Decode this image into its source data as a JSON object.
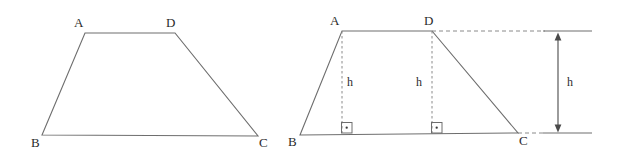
{
  "figure": {
    "stroke_color": "#6e6e6e",
    "dash_color": "#8a8a8a",
    "text_color": "#2b2b2b",
    "background_color": "#ffffff",
    "left_figure": {
      "name": "trapezoid-plain",
      "vertices": [
        {
          "id": "A",
          "label": "A",
          "x": 85,
          "y": 33,
          "label_x": 74,
          "label_y": 16
        },
        {
          "id": "D",
          "label": "D",
          "x": 175,
          "y": 33,
          "label_x": 166,
          "label_y": 16
        },
        {
          "id": "C",
          "label": "C",
          "x": 258,
          "y": 136,
          "label_x": 259,
          "label_y": 136
        },
        {
          "id": "B",
          "label": "B",
          "x": 42,
          "y": 135,
          "label_x": 31,
          "label_y": 136
        }
      ],
      "outline": "85,33 175,33 258,136 42,135"
    },
    "right_figure": {
      "name": "trapezoid-with-heights",
      "vertices": [
        {
          "id": "A",
          "label": "A",
          "x": 342,
          "y": 31,
          "label_x": 330,
          "label_y": 14
        },
        {
          "id": "D",
          "label": "D",
          "x": 432,
          "y": 31,
          "label_x": 424,
          "label_y": 14
        },
        {
          "id": "C",
          "label": "C",
          "x": 518,
          "y": 133,
          "label_x": 519,
          "label_y": 134
        },
        {
          "id": "B",
          "label": "B",
          "x": 300,
          "y": 135,
          "label_x": 288,
          "label_y": 135
        }
      ],
      "outline": "342,31 432,31 518,133 300,135",
      "altitudes": [
        {
          "name": "altitude-from-A",
          "x": 342,
          "y1": 31,
          "y2": 133,
          "label": "h",
          "label_x": 347,
          "label_y": 76
        },
        {
          "name": "altitude-from-D",
          "x": 432,
          "y1": 31,
          "y2": 133,
          "label": "h",
          "label_x": 416,
          "label_y": 76
        }
      ],
      "right_angle_marks": [
        {
          "name": "right-angle-mark-left",
          "x": 341,
          "y": 122,
          "size": 11
        },
        {
          "name": "right-angle-mark-right",
          "x": 431,
          "y": 122,
          "size": 11
        }
      ],
      "extension_lines": [
        {
          "name": "top-extension-dashed",
          "x1": 432,
          "y1": 31,
          "x2": 545,
          "y2": 31,
          "style": "dashed"
        },
        {
          "name": "top-extension-solid",
          "x1": 545,
          "y1": 31,
          "x2": 592,
          "y2": 31,
          "style": "solid"
        },
        {
          "name": "bottom-extension-dashed",
          "x1": 518,
          "y1": 133,
          "x2": 545,
          "y2": 133,
          "style": "dashed"
        },
        {
          "name": "bottom-extension-solid",
          "x1": 545,
          "y1": 133,
          "x2": 592,
          "y2": 133,
          "style": "solid"
        }
      ],
      "dimension_arrow": {
        "name": "height-dimension-arrow",
        "x": 558,
        "y_top": 35,
        "y_bottom": 130,
        "label": "h",
        "label_x": 567,
        "label_y": 76
      }
    }
  }
}
